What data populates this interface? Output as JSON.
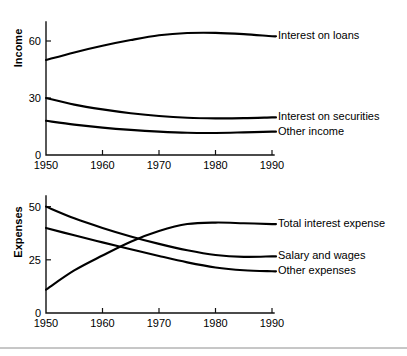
{
  "figure": {
    "name": "bank-income-and-expenses-line-charts",
    "background": "#ffffff",
    "line_color": "#000000",
    "axis_color": "#111111",
    "rule_color": "#8e8e8e"
  },
  "chart_data": [
    {
      "type": "line",
      "name": "income-chart",
      "title": "",
      "subtitle": "",
      "xlabel": "",
      "ylabel": "Income",
      "xlim": [
        1950,
        1990
      ],
      "ylim": [
        0,
        70
      ],
      "xticks": [
        1950,
        1960,
        1970,
        1980,
        1990
      ],
      "xticklabels": [
        "1950",
        "1960",
        "1970",
        "1980",
        "1990"
      ],
      "yticks": [
        0,
        30,
        60
      ],
      "yticklabels": [
        "0",
        "30",
        "60"
      ],
      "grid": false,
      "legend_position": "right-inline-labels",
      "x": [
        1950,
        1955,
        1960,
        1965,
        1970,
        1975,
        1980,
        1985,
        1990
      ],
      "series": [
        {
          "name": "Interest on loans",
          "label": "Interest on loans",
          "values": [
            50,
            54,
            57.5,
            60.5,
            63,
            64.2,
            64.3,
            63.6,
            62.5
          ]
        },
        {
          "name": "Interest on securities",
          "label": "Interest on securities",
          "values": [
            30,
            26.5,
            24,
            22,
            20.5,
            19.6,
            19.3,
            19.4,
            19.8
          ]
        },
        {
          "name": "Other income",
          "label": "Other income",
          "values": [
            18,
            16,
            14.4,
            13.2,
            12.3,
            11.7,
            11.6,
            11.9,
            12.3
          ]
        }
      ]
    },
    {
      "type": "line",
      "name": "expenses-chart",
      "title": "",
      "subtitle": "",
      "xlabel": "",
      "ylabel": "Expenses",
      "xlim": [
        1950,
        1990
      ],
      "ylim": [
        0,
        55
      ],
      "xticks": [
        1950,
        1960,
        1970,
        1980,
        1990
      ],
      "xticklabels": [
        "1950",
        "1960",
        "1970",
        "1980",
        "1990"
      ],
      "yticks": [
        0,
        25,
        50
      ],
      "yticklabels": [
        "0",
        "25",
        "50"
      ],
      "grid": false,
      "legend_position": "right-inline-labels",
      "x": [
        1950,
        1955,
        1960,
        1965,
        1970,
        1975,
        1980,
        1985,
        1990
      ],
      "series": [
        {
          "name": "Total interest expense",
          "label": "Total interest expense",
          "values": [
            11,
            20,
            27,
            33.5,
            38.5,
            41.8,
            42.5,
            42.2,
            41.8
          ]
        },
        {
          "name": "Salary and wages",
          "label": "Salary and wages",
          "values": [
            50,
            44.5,
            40,
            36,
            32.5,
            29.5,
            27.3,
            26.4,
            26.6
          ]
        },
        {
          "name": "Other expenses",
          "label": "Other expenses",
          "values": [
            40,
            36.5,
            33.2,
            30,
            26.8,
            23.8,
            21.4,
            20.1,
            19.6
          ]
        }
      ]
    }
  ]
}
